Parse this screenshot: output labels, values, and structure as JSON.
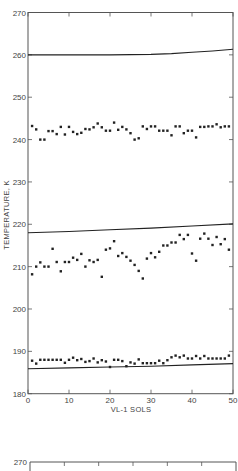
{
  "chart_data": [
    {
      "type": "scatter",
      "title": "",
      "xlabel": "VL-1 SOLS",
      "ylabel": "TEMPERATURE, K",
      "xlim": [
        0,
        50
      ],
      "ylim": [
        180,
        270
      ],
      "xticks": [
        0,
        10,
        20,
        30,
        40,
        50
      ],
      "yticks": [
        180,
        190,
        200,
        210,
        220,
        230,
        240,
        250,
        260,
        270
      ],
      "grid": false,
      "legend": null,
      "curves": [
        {
          "name": "upper-curve",
          "x": [
            0,
            10,
            20,
            30,
            35,
            40,
            45,
            50
          ],
          "y": [
            260.0,
            260.0,
            260.0,
            260.1,
            260.3,
            260.6,
            260.9,
            261.3
          ]
        },
        {
          "name": "middle-curve",
          "x": [
            0,
            10,
            20,
            30,
            40,
            50
          ],
          "y": [
            218.0,
            218.3,
            218.7,
            219.1,
            219.6,
            220.1
          ]
        },
        {
          "name": "lower-curve",
          "x": [
            0,
            10,
            20,
            30,
            40,
            50
          ],
          "y": [
            185.9,
            186.1,
            186.3,
            186.5,
            186.8,
            187.1
          ]
        }
      ],
      "series": [
        {
          "name": "upper-points",
          "x": [
            1,
            2,
            3,
            4,
            5,
            6,
            7,
            8,
            9,
            10,
            11,
            12,
            13,
            14,
            15,
            16,
            17,
            18,
            19,
            20,
            21,
            22,
            23,
            24,
            25,
            26,
            27,
            28,
            29,
            30,
            31,
            32,
            33,
            34,
            35,
            36,
            37,
            38,
            39,
            40,
            41,
            42,
            43,
            44,
            45,
            46,
            47,
            48,
            49
          ],
          "y": [
            243.2,
            242.4,
            240.0,
            240.0,
            242.0,
            242.0,
            241.3,
            243.0,
            241.2,
            243.0,
            241.8,
            241.3,
            241.6,
            242.5,
            242.4,
            242.9,
            243.8,
            242.9,
            242.1,
            242.1,
            244.0,
            242.3,
            243.0,
            242.4,
            241.5,
            240.0,
            240.3,
            243.1,
            242.5,
            243.1,
            243.1,
            242.1,
            242.1,
            242.1,
            241.0,
            243.1,
            243.1,
            241.5,
            242.1,
            242.1,
            240.5,
            243.0,
            243.0,
            243.1,
            243.1,
            243.6,
            242.9,
            243.1,
            243.1
          ]
        },
        {
          "name": "middle-points",
          "x": [
            1,
            2,
            3,
            4,
            5,
            6,
            7,
            8,
            9,
            10,
            11,
            12,
            13,
            14,
            15,
            16,
            17,
            18,
            19,
            20,
            21,
            22,
            23,
            24,
            25,
            26,
            27,
            28,
            29,
            30,
            31,
            32,
            33,
            34,
            35,
            36,
            37,
            38,
            39,
            40,
            41,
            42,
            43,
            44,
            45,
            46,
            47,
            48,
            49
          ],
          "y": [
            208.2,
            210.0,
            211.0,
            210.0,
            210.0,
            214.2,
            211.1,
            208.9,
            211.1,
            211.1,
            212.1,
            211.6,
            213.0,
            210.0,
            211.5,
            211.1,
            211.6,
            207.6,
            214.0,
            214.3,
            216.0,
            212.5,
            213.2,
            212.3,
            211.4,
            210.4,
            209.0,
            207.2,
            211.9,
            213.2,
            212.2,
            213.5,
            215.0,
            215.0,
            215.7,
            215.7,
            217.5,
            216.5,
            217.5,
            213.1,
            211.4,
            216.6,
            217.8,
            216.6,
            215.1,
            217.0,
            215.3,
            216.5,
            214.0
          ]
        },
        {
          "name": "lower-points",
          "x": [
            1,
            2,
            3,
            4,
            5,
            6,
            7,
            8,
            9,
            10,
            11,
            12,
            13,
            14,
            15,
            16,
            17,
            18,
            19,
            20,
            21,
            22,
            23,
            24,
            25,
            26,
            27,
            28,
            29,
            30,
            31,
            32,
            33,
            34,
            35,
            36,
            37,
            38,
            39,
            40,
            41,
            42,
            43,
            44,
            45,
            46,
            47,
            48,
            49
          ],
          "y": [
            187.8,
            187.1,
            188.0,
            188.0,
            188.0,
            188.0,
            188.0,
            188.0,
            187.3,
            188.0,
            188.5,
            187.9,
            188.2,
            187.5,
            187.7,
            188.3,
            187.4,
            187.9,
            187.6,
            186.3,
            188.0,
            188.0,
            187.7,
            186.5,
            187.4,
            187.1,
            188.1,
            187.2,
            187.2,
            187.2,
            187.2,
            187.8,
            187.2,
            187.9,
            188.6,
            189.0,
            188.6,
            189.0,
            188.3,
            188.3,
            188.9,
            188.3,
            188.9,
            188.3,
            188.3,
            188.3,
            188.3,
            188.3,
            189.0
          ]
        }
      ]
    },
    {
      "type": "scatter",
      "title": "",
      "note": "second chart, only top border visible (cropped)",
      "ylim_top_label": "270",
      "xtick_count": 7
    }
  ],
  "labels": {
    "ylabel": "TEMPERATURE, K",
    "xlabel": "VL-1 SOLS",
    "second_chart_top_label": "270"
  },
  "colors": {
    "ink": "#222222",
    "axis": "#555555",
    "background": "#ffffff"
  }
}
